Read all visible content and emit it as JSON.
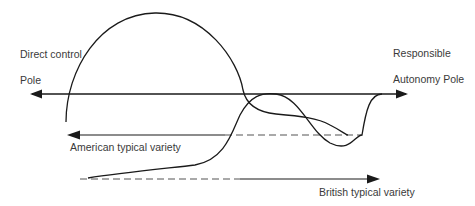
{
  "diagram": {
    "labels": {
      "left_pole_line1": "Direct control",
      "left_pole_line2": "Pole",
      "right_pole_line1": "Responsible",
      "right_pole_line2": "Autonomy Pole",
      "american": "American typical variety",
      "british": "British typical variety"
    },
    "colors": {
      "line": "#1a1a1a",
      "text": "#3a3a3a",
      "dashed": "#555555",
      "background": "#ffffff"
    }
  }
}
